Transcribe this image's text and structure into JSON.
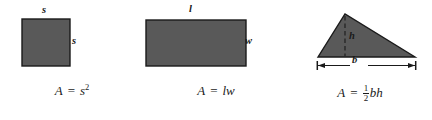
{
  "diagram": {
    "style": {
      "shape_fill": "#595959",
      "shape_stroke": "#1a1a1a",
      "text_color": "#1a1a1a",
      "background": "#ffffff"
    },
    "figures": [
      {
        "id": "square",
        "shape": "square",
        "labels": {
          "top": "s",
          "side": "s"
        },
        "formula": {
          "lhs": "A",
          "equals": "=",
          "rhs_base": "s",
          "rhs_exponent": "2"
        }
      },
      {
        "id": "rectangle",
        "shape": "rectangle",
        "labels": {
          "top": "l",
          "side": "w"
        },
        "formula": {
          "lhs": "A",
          "equals": "=",
          "rhs": "lw"
        }
      },
      {
        "id": "triangle",
        "shape": "triangle",
        "labels": {
          "height": "h",
          "base": "b"
        },
        "formula": {
          "lhs": "A",
          "equals": "=",
          "fraction_numerator": "1",
          "fraction_denominator": "2",
          "rhs": "bh"
        }
      }
    ]
  }
}
